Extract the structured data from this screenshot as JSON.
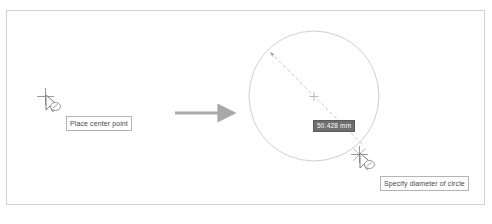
{
  "figure": {
    "background_color": "#ffffff",
    "frame_color": "#d2d2d2"
  },
  "steps": [
    {
      "id": "step-1",
      "name": "place-center-point",
      "tooltip": "Place center point",
      "cursor": {
        "icon": "crosshair-circle-cursor",
        "x": 48,
        "y": 100
      }
    },
    {
      "id": "step-2",
      "name": "specify-diameter",
      "tooltip": "Specify diameter of circle",
      "cursor": {
        "icon": "crosshair-circle-cursor",
        "x": 362,
        "y": 158
      }
    }
  ],
  "flow_arrow": {
    "icon": "arrow-right-icon",
    "color": "#a8a8a8",
    "x1": 175,
    "y1": 113,
    "x2": 225,
    "y2": 113
  },
  "circle": {
    "name": "drawn-circle",
    "center_x": 314,
    "center_y": 96,
    "radius": 65,
    "stroke_color": "#cfcfcf",
    "center_mark": "plus-marker",
    "diameter_line": {
      "color": "#c4c4c4",
      "style": "dashed",
      "arrowhead": "upper-left",
      "x1": 268,
      "y1": 50,
      "x2": 362,
      "y2": 144
    }
  },
  "dimension_input": {
    "name": "diameter-value-field",
    "value": "50.428 mm",
    "state": "selected",
    "background_color": "#6e6e6e",
    "text_color": "#ffffff"
  }
}
